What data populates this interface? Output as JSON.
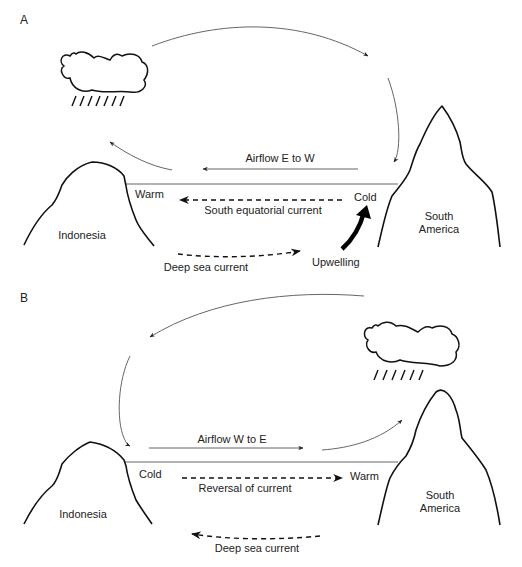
{
  "panels": [
    {
      "id": "A",
      "label": "A",
      "airflow_label": "Airflow E to W",
      "west_temp": "Warm",
      "east_temp": "Cold",
      "surface_current_label": "South equatorial current",
      "deep_current_label": "Deep sea current",
      "upwelling_label": "Upwelling",
      "west_land": "Indonesia",
      "east_land_line1": "South",
      "east_land_line2": "America",
      "rain_cloud_position": "west"
    },
    {
      "id": "B",
      "label": "B",
      "airflow_label": "Airflow W to E",
      "west_temp": "Cold",
      "east_temp": "Warm",
      "surface_current_label": "Reversal of current",
      "deep_current_label": "Deep sea current",
      "west_land": "Indonesia",
      "east_land_line1": "South",
      "east_land_line2": "America",
      "rain_cloud_position": "east"
    }
  ],
  "icons": {
    "cloud": "rain-cloud-icon",
    "arrow": "arrow-icon"
  },
  "colors": {
    "line": "#111111",
    "thin_line": "#555555",
    "background": "#ffffff"
  }
}
